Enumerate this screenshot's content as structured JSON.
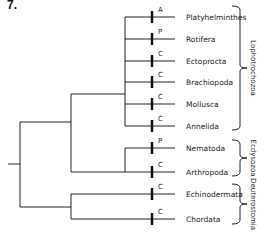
{
  "figure": {
    "number_label": "7.",
    "type": "phylogenetic-tree",
    "taxa": [
      {
        "name": "Platyhelminthes",
        "mark": "A",
        "y": 17
      },
      {
        "name": "Rotifera",
        "mark": "P",
        "y": 39
      },
      {
        "name": "Ectoprocta",
        "mark": "C",
        "y": 61
      },
      {
        "name": "Brachiopoda",
        "mark": "C",
        "y": 82
      },
      {
        "name": "Mollusca",
        "mark": "C",
        "y": 104
      },
      {
        "name": "Annelida",
        "mark": "C",
        "y": 126
      },
      {
        "name": "Nematoda",
        "mark": "P",
        "y": 148
      },
      {
        "name": "Arthropoda",
        "mark": "C",
        "y": 172
      },
      {
        "name": "Echinodermata",
        "mark": "C",
        "y": 194
      },
      {
        "name": "Chordata",
        "mark": "C",
        "y": 219
      }
    ],
    "clades": [
      {
        "name": "Lophotrochozoa",
        "members": [
          "Platyhelminthes",
          "Rotifera",
          "Ectoprocta",
          "Brachiopoda",
          "Mollusca",
          "Annelida"
        ],
        "y_top": 6,
        "y_bottom": 130
      },
      {
        "name": "Ecdysozoa",
        "members": [
          "Nematoda",
          "Arthropoda"
        ],
        "y_top": 140,
        "y_bottom": 176
      },
      {
        "name": "Deuterostomia",
        "members": [
          "Echinodermata",
          "Chordata"
        ],
        "y_top": 184,
        "y_bottom": 224
      }
    ],
    "stroke_color": "#222222"
  }
}
